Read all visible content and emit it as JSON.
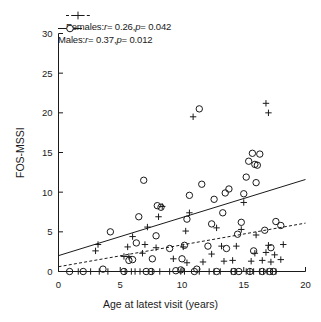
{
  "chart_data": {
    "type": "scatter",
    "title": "",
    "xlabel": "Age at latest visit (years)",
    "ylabel": "FOS-MSSI",
    "xlim": [
      0,
      20
    ],
    "ylim": [
      0,
      30
    ],
    "xticks": [
      0,
      5,
      10,
      15,
      20
    ],
    "yticks": [
      0,
      5,
      10,
      15,
      20,
      25,
      30
    ],
    "grid": false,
    "legend_position": "above-plot-left",
    "series": [
      {
        "name": "Females",
        "marker": "plus",
        "linestyle": "dashed",
        "color": "#1a1a1a",
        "r": 0.26,
        "p": 0.042,
        "legend_label": "Females: r = 0.26, p = 0.042",
        "fit_line": {
          "x": [
            0,
            20
          ],
          "y": [
            0.6,
            6.1
          ]
        },
        "points": [
          [
            1.6,
            0.0
          ],
          [
            2.6,
            0.0
          ],
          [
            3.3,
            0.0
          ],
          [
            4.0,
            0.0
          ],
          [
            3.0,
            2.6
          ],
          [
            3.2,
            3.4
          ],
          [
            5.4,
            0.0
          ],
          [
            5.9,
            0.0
          ],
          [
            6.2,
            0.0
          ],
          [
            6.6,
            0.0
          ],
          [
            5.3,
            1.9
          ],
          [
            5.7,
            1.9
          ],
          [
            5.6,
            3.1
          ],
          [
            6.0,
            4.4
          ],
          [
            6.8,
            2.3
          ],
          [
            7.0,
            3.4
          ],
          [
            7.2,
            5.6
          ],
          [
            7.6,
            0.0
          ],
          [
            8.2,
            0.0
          ],
          [
            7.9,
            3.0
          ],
          [
            8.1,
            6.9
          ],
          [
            8.4,
            8.2
          ],
          [
            9.0,
            0.0
          ],
          [
            9.3,
            1.6
          ],
          [
            9.9,
            0.0
          ],
          [
            10.2,
            0.0
          ],
          [
            10.4,
            1.1
          ],
          [
            10.1,
            3.1
          ],
          [
            10.3,
            5.1
          ],
          [
            10.6,
            7.4
          ],
          [
            10.9,
            19.5
          ],
          [
            11.4,
            0.0
          ],
          [
            11.7,
            1.2
          ],
          [
            12.2,
            0.0
          ],
          [
            12.6,
            0.0
          ],
          [
            12.4,
            2.2
          ],
          [
            12.8,
            5.5
          ],
          [
            13.1,
            0.0
          ],
          [
            13.4,
            1.3
          ],
          [
            13.2,
            3.2
          ],
          [
            14.0,
            0.0
          ],
          [
            14.3,
            0.0
          ],
          [
            14.1,
            1.4
          ],
          [
            14.4,
            3.2
          ],
          [
            14.8,
            5.3
          ],
          [
            15.0,
            8.7
          ],
          [
            15.2,
            0.0
          ],
          [
            15.5,
            0.0
          ],
          [
            15.8,
            0.0
          ],
          [
            15.6,
            1.3
          ],
          [
            15.9,
            2.3
          ],
          [
            16.0,
            4.6
          ],
          [
            16.3,
            0.0
          ],
          [
            16.6,
            0.0
          ],
          [
            16.9,
            0.0
          ],
          [
            16.5,
            1.4
          ],
          [
            16.8,
            2.4
          ],
          [
            17.0,
            3.3
          ],
          [
            17.3,
            0.0
          ],
          [
            17.6,
            0.0
          ],
          [
            17.2,
            1.2
          ],
          [
            17.5,
            2.1
          ],
          [
            17.0,
            20.0
          ],
          [
            16.8,
            21.2
          ],
          [
            18.0,
            1.5
          ],
          [
            18.2,
            3.4
          ]
        ]
      },
      {
        "name": "Males",
        "marker": "circle",
        "linestyle": "solid",
        "color": "#1a1a1a",
        "r": 0.37,
        "p": 0.012,
        "legend_label": "Males: r = 0.37, p = 0.012",
        "fit_line": {
          "x": [
            0,
            20
          ],
          "y": [
            2.0,
            11.6
          ]
        },
        "points": [
          [
            0.9,
            0.0
          ],
          [
            2.0,
            0.0
          ],
          [
            3.6,
            0.3
          ],
          [
            4.2,
            5.0
          ],
          [
            5.3,
            0.0
          ],
          [
            5.7,
            1.4
          ],
          [
            6.0,
            1.5
          ],
          [
            6.3,
            3.6
          ],
          [
            6.5,
            6.9
          ],
          [
            6.9,
            11.5
          ],
          [
            7.1,
            0.0
          ],
          [
            7.5,
            0.0
          ],
          [
            7.6,
            1.6
          ],
          [
            7.9,
            4.5
          ],
          [
            8.0,
            8.3
          ],
          [
            8.3,
            8.1
          ],
          [
            9.0,
            2.9
          ],
          [
            9.5,
            0.1
          ],
          [
            9.9,
            0.2
          ],
          [
            10.0,
            1.6
          ],
          [
            10.2,
            3.3
          ],
          [
            10.4,
            6.6
          ],
          [
            10.6,
            9.6
          ],
          [
            11.0,
            0.0
          ],
          [
            11.2,
            0.3
          ],
          [
            11.4,
            20.5
          ],
          [
            11.6,
            11.0
          ],
          [
            12.1,
            3.2
          ],
          [
            12.4,
            6.0
          ],
          [
            12.6,
            9.1
          ],
          [
            12.8,
            0.0
          ],
          [
            13.3,
            7.4
          ],
          [
            13.5,
            9.9
          ],
          [
            13.8,
            10.4
          ],
          [
            13.6,
            2.9
          ],
          [
            14.2,
            0.0
          ],
          [
            14.6,
            0.0
          ],
          [
            14.5,
            4.7
          ],
          [
            14.8,
            6.2
          ],
          [
            15.0,
            9.8
          ],
          [
            15.2,
            11.9
          ],
          [
            15.4,
            13.9
          ],
          [
            15.7,
            14.9
          ],
          [
            15.9,
            13.5
          ],
          [
            16.1,
            13.4
          ],
          [
            16.3,
            14.8
          ],
          [
            16.0,
            11.2
          ],
          [
            15.5,
            0.0
          ],
          [
            15.8,
            2.6
          ],
          [
            16.5,
            0.0
          ],
          [
            16.7,
            5.2
          ],
          [
            17.1,
            0.0
          ],
          [
            17.4,
            0.0
          ],
          [
            17.2,
            3.0
          ],
          [
            17.6,
            6.3
          ],
          [
            18.0,
            5.8
          ]
        ]
      }
    ]
  },
  "axes": {
    "xtick_labels": [
      "0",
      "5",
      "10",
      "15",
      "20"
    ],
    "ytick_labels": [
      "0",
      "5",
      "10",
      "15",
      "20",
      "25",
      "30"
    ],
    "xlabel": "Age at latest visit (years)",
    "ylabel": "FOS-MSSI"
  },
  "legend": {
    "females": {
      "name": "Females",
      "prefix": "Females:",
      "r_label": "r",
      "r_value": "= 0.26,",
      "p_label": "p",
      "p_value": "= 0.042"
    },
    "males": {
      "name": "Males",
      "prefix": "Males:",
      "r_label": "r",
      "r_value": "= 0.37,",
      "p_label": "p",
      "p_value": "= 0.012"
    }
  }
}
